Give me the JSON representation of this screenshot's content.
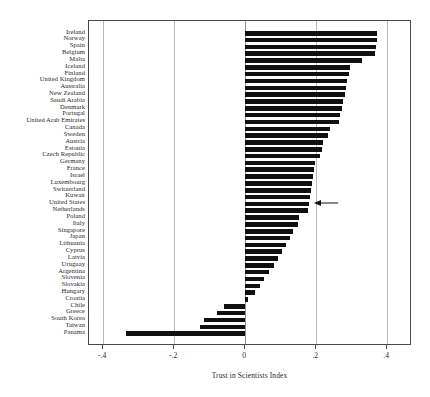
{
  "chart_data": {
    "type": "bar",
    "orientation": "horizontal",
    "title": "",
    "xlabel": "Trust in Scientists Index",
    "ylabel": "",
    "xlim": [
      -0.44,
      0.47
    ],
    "xticks": [
      -0.4,
      -0.2,
      0.0,
      0.2,
      0.4
    ],
    "xticklabels": [
      "-.4",
      "-.2",
      "0",
      ".2",
      ".4"
    ],
    "grid": "vertical-at-xticks",
    "legend": "none",
    "bar_color": "#101010",
    "categories": [
      "Ireland",
      "Norway",
      "Spain",
      "Belgium",
      "Malta",
      "Iceland",
      "Finland",
      "United Kingdom",
      "Australia",
      "New Zealand",
      "Saudi Arabia",
      "Denmark",
      "Portugal",
      "United Arab Emirates",
      "Canada",
      "Sweden",
      "Austria",
      "Estonia",
      "Czech Republic",
      "Germany",
      "France",
      "Israel",
      "Luxembourg",
      "Switzerland",
      "Kuwait",
      "United States",
      "Netherlands",
      "Poland",
      "Italy",
      "Singapore",
      "Japan",
      "Lithuania",
      "Cyprus",
      "Latvia",
      "Uruguay",
      "Argentina",
      "Slovenia",
      "Slovakia",
      "Hungary",
      "Croatia",
      "Chile",
      "Greece",
      "South Korea",
      "Taiwan",
      "Panama"
    ],
    "values": [
      0.372,
      0.37,
      0.368,
      0.366,
      0.33,
      0.296,
      0.292,
      0.288,
      0.284,
      0.28,
      0.276,
      0.272,
      0.268,
      0.264,
      0.238,
      0.232,
      0.22,
      0.216,
      0.212,
      0.197,
      0.194,
      0.191,
      0.188,
      0.185,
      0.182,
      0.179,
      0.176,
      0.152,
      0.149,
      0.136,
      0.126,
      0.116,
      0.105,
      0.093,
      0.08,
      0.066,
      0.053,
      0.041,
      0.029,
      0.009,
      -0.06,
      -0.078,
      -0.116,
      -0.126,
      -0.335
    ],
    "annotations": [
      {
        "name": "united-states-arrow",
        "type": "arrow",
        "points_to_category": "United States",
        "direction": "left",
        "x_start": 0.265,
        "x_end": 0.197
      }
    ]
  }
}
